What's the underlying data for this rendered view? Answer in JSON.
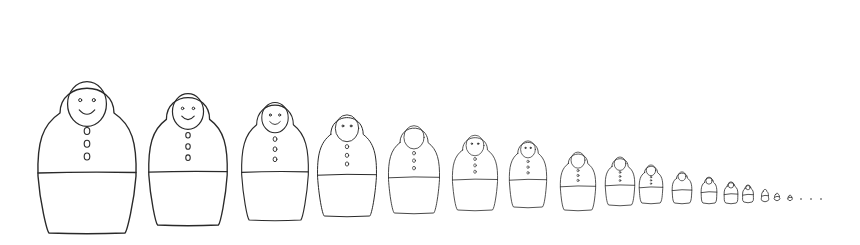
{
  "image": {
    "description": "Hand-drawn line sketch of a row of Russian nesting dolls (matryoshka) decreasing in size from left to right",
    "background": "#ffffff",
    "stroke_color": "#2a2a2a"
  },
  "dolls": [
    {
      "cx": 87,
      "top": 83,
      "bottom": 233,
      "w": 100,
      "face": "smile",
      "buttons": 3
    },
    {
      "cx": 188,
      "top": 93,
      "bottom": 225,
      "w": 80,
      "face": "smile",
      "buttons": 3
    },
    {
      "cx": 275,
      "top": 101,
      "bottom": 220,
      "w": 68,
      "face": "smile",
      "buttons": 3
    },
    {
      "cx": 347,
      "top": 114,
      "bottom": 216,
      "w": 60,
      "face": "eyes",
      "buttons": 3
    },
    {
      "cx": 414,
      "top": 125,
      "bottom": 213,
      "w": 52,
      "face": "blank",
      "buttons": 3
    },
    {
      "cx": 475,
      "top": 135,
      "bottom": 210,
      "w": 46,
      "face": "eyes",
      "buttons": 3
    },
    {
      "cx": 528,
      "top": 140,
      "bottom": 207,
      "w": 38,
      "face": "eyes",
      "buttons": 3
    },
    {
      "cx": 578,
      "top": 152,
      "bottom": 210,
      "w": 36,
      "face": "blank",
      "buttons": 3
    },
    {
      "cx": 620,
      "top": 157,
      "bottom": 205,
      "w": 30,
      "face": "blank",
      "buttons": 3
    },
    {
      "cx": 651,
      "top": 165,
      "bottom": 203,
      "w": 24,
      "face": "blank",
      "buttons": 3
    },
    {
      "cx": 682,
      "top": 172,
      "bottom": 203,
      "w": 20,
      "face": "blank",
      "buttons": 0
    },
    {
      "cx": 709,
      "top": 177,
      "bottom": 203,
      "w": 16,
      "face": "blank",
      "buttons": 0
    },
    {
      "cx": 731,
      "top": 182,
      "bottom": 203,
      "w": 14,
      "face": "blank",
      "buttons": 0
    },
    {
      "cx": 748,
      "top": 185,
      "bottom": 202,
      "w": 11,
      "face": "blank",
      "buttons": 0
    },
    {
      "cx": 765,
      "top": 189,
      "bottom": 201,
      "w": 7,
      "face": "none",
      "buttons": 0
    },
    {
      "cx": 777,
      "top": 193,
      "bottom": 200,
      "w": 5,
      "face": "none",
      "buttons": 0
    },
    {
      "cx": 790,
      "top": 195,
      "bottom": 200,
      "w": 4,
      "face": "none",
      "buttons": 0
    }
  ],
  "dots": [
    {
      "x": 801,
      "y": 199
    },
    {
      "x": 811,
      "y": 199
    },
    {
      "x": 821,
      "y": 199
    }
  ]
}
